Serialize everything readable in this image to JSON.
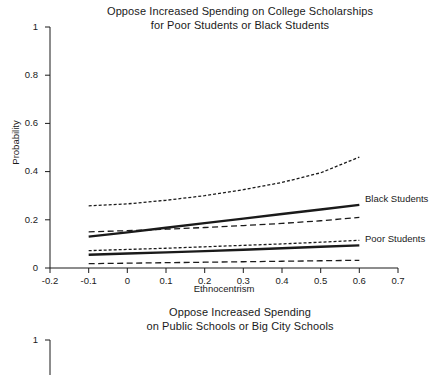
{
  "figure": {
    "background": "#ffffff",
    "ink_color": "#1a1a1a"
  },
  "panels": [
    {
      "id": "college-scholarships",
      "title": "Oppose Increased Spending on College Scholarships\nfor Poor Students or Black Students",
      "title_line1": "Oppose Increased Spending on College Scholarships",
      "title_line2": "for Poor Students or Black Students",
      "xlabel": "Ethnocentrism",
      "ylabel": "Probability",
      "ytick_labels": [
        "1",
        "0.8",
        "0.6",
        "0.4",
        "0.2",
        "0"
      ],
      "xtick_labels": [
        "-0.2",
        "-0.1",
        "0",
        "0.1",
        "0.2",
        "0.3",
        "0.4",
        "0.5",
        "0.6",
        "0.7"
      ],
      "series_labels": [
        "Black Students",
        "Poor Students"
      ]
    },
    {
      "id": "public-schools",
      "title": "Oppose Increased Spending\non Public Schools or Big City Schools",
      "title_line1": "Oppose Increased Spending",
      "title_line2": "on Public Schools or Big City Schools",
      "ytick_labels": [
        "1"
      ]
    }
  ],
  "chart_data": {
    "type": "line",
    "xlabel": "Ethnocentrism",
    "ylabel": "Probability",
    "xlim": [
      -0.2,
      0.7
    ],
    "ylim": [
      0,
      1
    ],
    "xticks": [
      -0.2,
      -0.1,
      0,
      0.1,
      0.2,
      0.3,
      0.4,
      0.5,
      0.6,
      0.7
    ],
    "yticks": [
      0,
      0.2,
      0.4,
      0.6,
      0.8,
      1
    ],
    "grid": false,
    "legend": "inline-right-labels",
    "x": [
      -0.1,
      0.0,
      0.1,
      0.2,
      0.3,
      0.4,
      0.5,
      0.6
    ],
    "series": [
      {
        "name": "Black Students",
        "style": "solid-thick",
        "role": "estimate",
        "values": [
          0.13,
          0.148,
          0.167,
          0.186,
          0.205,
          0.224,
          0.243,
          0.262
        ]
      },
      {
        "name": "Black Students upper CI",
        "style": "dotted",
        "role": "confidence-upper",
        "values": [
          0.258,
          0.266,
          0.281,
          0.3,
          0.325,
          0.355,
          0.395,
          0.46
        ]
      },
      {
        "name": "Black Students lower CI",
        "style": "dashed",
        "role": "confidence-lower",
        "values": [
          0.15,
          0.155,
          0.161,
          0.168,
          0.176,
          0.185,
          0.196,
          0.21
        ]
      },
      {
        "name": "Poor Students",
        "style": "solid-thick",
        "role": "estimate",
        "values": [
          0.055,
          0.06,
          0.065,
          0.07,
          0.076,
          0.082,
          0.088,
          0.094
        ]
      },
      {
        "name": "Poor Students upper CI",
        "style": "dotted",
        "role": "confidence-upper",
        "values": [
          0.072,
          0.077,
          0.082,
          0.088,
          0.094,
          0.1,
          0.107,
          0.115
        ]
      },
      {
        "name": "Poor Students lower CI",
        "style": "dashed",
        "role": "confidence-lower",
        "values": [
          0.018,
          0.02,
          0.022,
          0.024,
          0.026,
          0.028,
          0.03,
          0.032
        ]
      }
    ]
  }
}
